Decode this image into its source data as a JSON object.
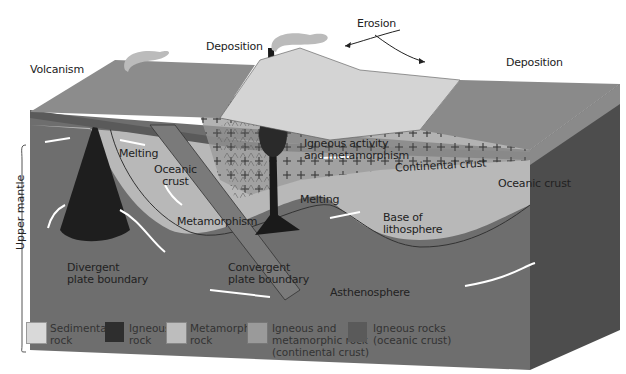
{
  "labels": {
    "erosion": "Erosion",
    "deposition_left": "Deposition",
    "deposition_right": "Deposition",
    "volcanism": "Volcanism",
    "melting_left": "Melting",
    "oceanic_crust_left": "Oceanic\ncrust",
    "igneous_activity": "Igneous activity\nand metamorphism",
    "continental_crust": "Continental crust",
    "oceanic_crust_right": "Oceanic crust",
    "metamorphism": "Metamorphism",
    "melting_center": "Melting",
    "base_of_lithosphere": "Base of\nlithosphere",
    "upper_mantle": "Upper mantle",
    "divergent": "Divergent\nplate boundary",
    "convergent": "Convergent\nplate boundary",
    "asthenosphere": "Asthenosphere"
  },
  "legend": [
    {
      "id": "sedimentary",
      "label": "Sedimentary\nrock",
      "color": "#d9d9d9"
    },
    {
      "id": "igneous",
      "label": "Igneous\nrock",
      "color": "#2e2e2e"
    },
    {
      "id": "metamorphic",
      "label": "Metamorphic\nrock",
      "color": "#bdbdbd"
    },
    {
      "id": "igneous-metamorphic-continental",
      "label": "Igneous and\nmetamorphic rock\n(continental crust)",
      "color": "#9a9a9a"
    },
    {
      "id": "igneous-oceanic",
      "label": "Igneous rocks\n(oceanic crust)",
      "color": "#5a5a5a"
    }
  ],
  "colors": {
    "mantle_dark": "#6e6e6e",
    "lithosphere_light": "#b8b8b8",
    "surface_light": "#d4d4d4",
    "ocean_floor": "#8c8c8c",
    "side_dark": "#4d4d4d"
  }
}
